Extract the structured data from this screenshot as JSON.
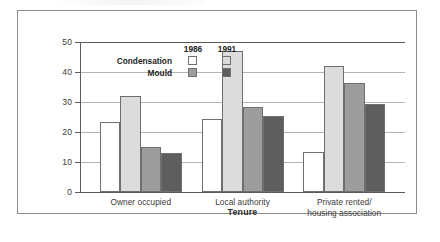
{
  "chart_data": {
    "type": "bar",
    "title": "",
    "xlabel": "Tenure",
    "ylabel": "% of households",
    "categories": [
      "Owner occupied",
      "Local authority",
      "Private rented/\nhousing association"
    ],
    "category_lines": [
      [
        "Owner occupied"
      ],
      [
        "Local authority"
      ],
      [
        "Private rented/",
        "housing association"
      ]
    ],
    "series": [
      {
        "name": "Condensation 1986",
        "problem": "Condensation",
        "year": "1986",
        "color": "#ffffff",
        "values": [
          23.5,
          24.5,
          13.5
        ]
      },
      {
        "name": "Condensation 1991",
        "problem": "Condensation",
        "year": "1991",
        "color": "#dcdcdc",
        "values": [
          32.0,
          47.0,
          42.0
        ]
      },
      {
        "name": "Mould 1986",
        "problem": "Mould",
        "year": "1986",
        "color": "#9d9d9d",
        "values": [
          15.0,
          28.5,
          36.5
        ]
      },
      {
        "name": "Mould 1991",
        "problem": "Mould",
        "year": "1991",
        "color": "#5e5e5e",
        "values": [
          13.0,
          25.5,
          29.5
        ]
      }
    ],
    "ylim": [
      0,
      50
    ],
    "yticks": [
      0,
      10,
      20,
      30,
      40,
      50
    ],
    "ytick_labels": [
      "0",
      "10",
      "20",
      "30",
      "40",
      "50"
    ],
    "grid": true,
    "grid_axis": "y",
    "legend_position": "inside-top-left"
  },
  "legend": {
    "years": [
      "1986",
      "1991"
    ],
    "rows": [
      {
        "label": "Condensation",
        "swatches": [
          "#ffffff",
          "#dcdcdc"
        ]
      },
      {
        "label": "Mould",
        "swatches": [
          "#9d9d9d",
          "#5e5e5e"
        ]
      }
    ]
  },
  "axis": {
    "y_title": "% of households",
    "x_title": "Tenure"
  }
}
